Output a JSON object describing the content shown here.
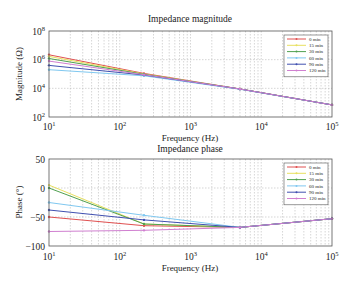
{
  "chart_data": [
    {
      "type": "line",
      "title": "Impedance magnitude",
      "xlabel": "Frequency (Hz)",
      "ylabel": "Magnitude (Ω)",
      "xscale": "log",
      "yscale": "log",
      "xlim": [
        10,
        100000
      ],
      "ylim": [
        100,
        100000000
      ],
      "xticks": [
        "10^1",
        "10^2",
        "10^3",
        "10^4",
        "10^5"
      ],
      "yticks": [
        "10^2",
        "10^4",
        "10^6",
        "10^8"
      ],
      "grid": true,
      "legend_position": "upper right",
      "x": [
        10,
        220,
        5000,
        100000
      ],
      "series": [
        {
          "name": "0 min",
          "color": "#e05050",
          "values": [
            2200000,
            110000,
            9000,
            700
          ]
        },
        {
          "name": "15 min",
          "color": "#e8e060",
          "values": [
            1700000,
            100000,
            9000,
            700
          ]
        },
        {
          "name": "30 min",
          "color": "#50a050",
          "values": [
            1200000,
            95000,
            9000,
            700
          ]
        },
        {
          "name": "60 min",
          "color": "#80c8f0",
          "values": [
            200000,
            75000,
            8500,
            700
          ]
        },
        {
          "name": "90 min",
          "color": "#4050b0",
          "values": [
            400000,
            85000,
            9000,
            700
          ]
        },
        {
          "name": "120 min",
          "color": "#d080d0",
          "values": [
            800000,
            90000,
            9000,
            700
          ]
        }
      ]
    },
    {
      "type": "line",
      "title": "Impedance phase",
      "xlabel": "Frequency (Hz)",
      "ylabel": "Phase (°)",
      "xscale": "log",
      "xlim": [
        10,
        100000
      ],
      "ylim": [
        -100,
        50
      ],
      "xticks": [
        "10^1",
        "10^2",
        "10^3",
        "10^4",
        "10^5"
      ],
      "yticks": [
        "50",
        "0",
        "-50",
        "-100"
      ],
      "grid": true,
      "legend_position": "upper right",
      "x": [
        10,
        220,
        5000,
        100000
      ],
      "series": [
        {
          "name": "0 min",
          "color": "#e05050",
          "values": [
            -50,
            -65,
            -68,
            -53
          ]
        },
        {
          "name": "15 min",
          "color": "#e8e060",
          "values": [
            5,
            -62,
            -68,
            -53
          ]
        },
        {
          "name": "30 min",
          "color": "#50a050",
          "values": [
            0,
            -62,
            -68,
            -53
          ]
        },
        {
          "name": "60 min",
          "color": "#80c8f0",
          "values": [
            -25,
            -47,
            -68,
            -53
          ]
        },
        {
          "name": "90 min",
          "color": "#4050b0",
          "values": [
            -38,
            -55,
            -68,
            -53
          ]
        },
        {
          "name": "120 min",
          "color": "#d080d0",
          "values": [
            -75,
            -73,
            -68,
            -53
          ]
        }
      ]
    }
  ],
  "plots": {
    "magnitude": {
      "title": "Impedance magnitude",
      "xlabel": "Frequency (Hz)",
      "ylabel": "Magnitude (Ω)",
      "ytick_labels": [
        {
          "base": "10",
          "exp": "8"
        },
        {
          "base": "10",
          "exp": "6"
        },
        {
          "base": "10",
          "exp": "4"
        },
        {
          "base": "10",
          "exp": "2"
        }
      ],
      "xtick_labels": [
        {
          "base": "10",
          "exp": "1"
        },
        {
          "base": "10",
          "exp": "2"
        },
        {
          "base": "10",
          "exp": "3"
        },
        {
          "base": "10",
          "exp": "4"
        },
        {
          "base": "10",
          "exp": "5"
        }
      ]
    },
    "phase": {
      "title": "Impedance phase",
      "xlabel": "Frequency (Hz)",
      "ylabel": "Phase (°)",
      "ytick_labels": [
        "50",
        "0",
        "−50",
        "−100"
      ],
      "xtick_labels": [
        {
          "base": "10",
          "exp": "1"
        },
        {
          "base": "10",
          "exp": "2"
        },
        {
          "base": "10",
          "exp": "3"
        },
        {
          "base": "10",
          "exp": "4"
        },
        {
          "base": "10",
          "exp": "5"
        }
      ]
    },
    "legend": [
      "0 min",
      "15 min",
      "30 min",
      "60 min",
      "90 min",
      "120 min"
    ]
  }
}
